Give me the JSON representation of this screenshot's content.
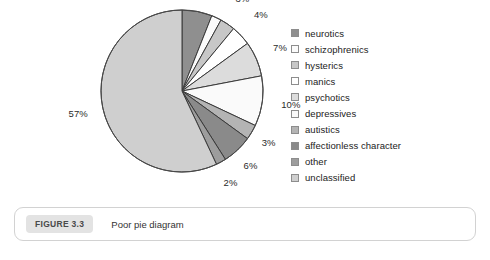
{
  "figure": {
    "badge_label": "FIGURE 3.3",
    "caption": "Poor pie diagram"
  },
  "legend": {
    "items": [
      {
        "label": "neurotics",
        "color": "#8f8f8f"
      },
      {
        "label": "schizophrenics",
        "color": "#fbfbfb"
      },
      {
        "label": "hysterics",
        "color": "#c7c7c7"
      },
      {
        "label": "manics",
        "color": "#ffffff"
      },
      {
        "label": "psychotics",
        "color": "#dcdcdc"
      },
      {
        "label": "depressives",
        "color": "#fafafa"
      },
      {
        "label": "autistics",
        "color": "#b4b4b4"
      },
      {
        "label": "affectionless character",
        "color": "#8a8a8a"
      },
      {
        "label": "other",
        "color": "#9d9d9d"
      },
      {
        "label": "unclassified",
        "color": "#cfcfcf"
      }
    ]
  },
  "chart_data": {
    "type": "pie",
    "title": "Poor pie diagram",
    "xlabel": "",
    "ylabel": "",
    "legend_position": "right",
    "grid": false,
    "total_percent": 100,
    "start_angle_deg": 0,
    "direction": "clockwise",
    "categories": [
      "neurotics",
      "schizophrenics",
      "hysterics",
      "manics",
      "psychotics",
      "depressives",
      "autistics",
      "affectionless character",
      "other",
      "unclassified"
    ],
    "values": [
      6,
      2,
      3,
      4,
      7,
      10,
      3,
      6,
      2,
      57
    ],
    "slices": [
      {
        "label": "neurotics",
        "value": 6,
        "display": "6%",
        "color": "#8f8f8f"
      },
      {
        "label": "schizophrenics",
        "value": 2,
        "display": "2%",
        "color": "#fbfbfb"
      },
      {
        "label": "hysterics",
        "value": 3,
        "display": "3%",
        "color": "#c7c7c7"
      },
      {
        "label": "manics",
        "value": 4,
        "display": "4%",
        "color": "#ffffff"
      },
      {
        "label": "psychotics",
        "value": 7,
        "display": "7%",
        "color": "#dcdcdc"
      },
      {
        "label": "depressives",
        "value": 10,
        "display": "10%",
        "color": "#fafafa"
      },
      {
        "label": "autistics",
        "value": 3,
        "display": "3%",
        "color": "#b4b4b4"
      },
      {
        "label": "affectionless character",
        "value": 6,
        "display": "6%",
        "color": "#8a8a8a"
      },
      {
        "label": "other",
        "value": 2,
        "display": "2%",
        "color": "#9d9d9d"
      },
      {
        "label": "unclassified",
        "value": 57,
        "display": "57%",
        "color": "#cfcfcf"
      }
    ],
    "data_labels": [
      "6%",
      "2%",
      "3%",
      "4%",
      "7%",
      "10%",
      "3%",
      "6%",
      "2%",
      "57%"
    ]
  }
}
